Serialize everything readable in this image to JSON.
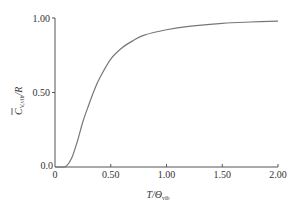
{
  "chart_data": {
    "type": "line",
    "title": "",
    "xlabel": "T/Θvib",
    "ylabel": "C̄V,vib/R",
    "xlim": [
      0,
      2.0
    ],
    "ylim": [
      0,
      1.0
    ],
    "grid": false,
    "legend": null,
    "x_ticks": [
      "0",
      "0.50",
      "1.00",
      "1.50",
      "2.00"
    ],
    "y_ticks": [
      "0.0",
      "0.50",
      "1.00"
    ],
    "series": [
      {
        "name": "Einstein vibrational heat capacity",
        "x": [
          0.0,
          0.05,
          0.1,
          0.15,
          0.2,
          0.25,
          0.3,
          0.35,
          0.4,
          0.5,
          0.6,
          0.7,
          0.8,
          1.0,
          1.2,
          1.5,
          1.75,
          2.0
        ],
        "y": [
          0.0,
          0.0,
          0.005,
          0.06,
          0.171,
          0.304,
          0.411,
          0.512,
          0.596,
          0.724,
          0.799,
          0.848,
          0.885,
          0.921,
          0.944,
          0.964,
          0.973,
          0.979
        ]
      }
    ]
  },
  "axes": {
    "x_label_main": "T/Θ",
    "x_label_sub": "vib",
    "y_label_main": "C",
    "y_label_sub": "V,vib",
    "y_label_tail": "/R",
    "x_ticks": [
      "0",
      "0.50",
      "1.00",
      "1.50",
      "2.00"
    ],
    "y_ticks": [
      "0.0",
      "0.50",
      "1.00"
    ]
  },
  "colors": {
    "axis": "#555555",
    "curve": "#777777",
    "text": "#333333"
  }
}
